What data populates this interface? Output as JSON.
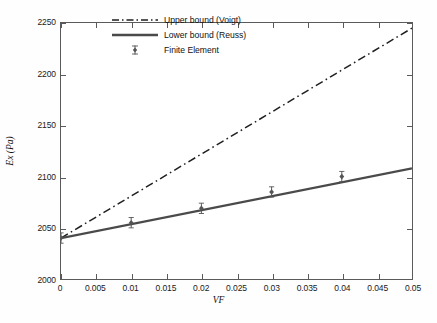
{
  "chart_data": {
    "type": "line",
    "title": "",
    "xlabel": "VF",
    "ylabel": "Ex (Pa)",
    "xlim": [
      0,
      0.05
    ],
    "ylim": [
      2000,
      2250
    ],
    "grid": false,
    "legend_position": "upper-center-left-inside",
    "xticks": [
      0,
      0.005,
      0.01,
      0.015,
      0.02,
      0.025,
      0.03,
      0.035,
      0.04,
      0.045,
      0.05
    ],
    "xticklabels": [
      "0",
      "0.005",
      "0.01",
      "0.015",
      "0.02",
      "0.025",
      "0.03",
      "0.035",
      "0.04",
      "0.045",
      "0.05"
    ],
    "yticks": [
      2000,
      2050,
      2100,
      2150,
      2200,
      2250
    ],
    "yticklabels": [
      "2000",
      "2050",
      "2100",
      "2150",
      "2200",
      "2250"
    ],
    "series": [
      {
        "name": "Upper bound (Voigt)",
        "style": "dash-dot",
        "color": "#1f1f1f",
        "x": [
          0,
          0.05
        ],
        "values": [
          2040,
          2245
        ]
      },
      {
        "name": "Lower bound (Reuss)",
        "style": "solid",
        "color": "#4a4a4a",
        "x": [
          0,
          0.05
        ],
        "values": [
          2040,
          2108
        ]
      },
      {
        "name": "Finite Element",
        "style": "marker",
        "marker": "diamond-with-errorbar",
        "color": "#555555",
        "x": [
          0,
          0.01,
          0.02,
          0.03,
          0.04
        ],
        "values": [
          2040,
          2055,
          2069,
          2085,
          2100
        ]
      }
    ]
  },
  "legend": {
    "items": [
      {
        "label": "Upper bound (Voigt)",
        "key": "dashdot-line-key"
      },
      {
        "label": "Lower bound (Reuss)",
        "key": "solid-line-key"
      },
      {
        "label": "Finite Element",
        "key": "diamond-marker-key"
      }
    ]
  }
}
